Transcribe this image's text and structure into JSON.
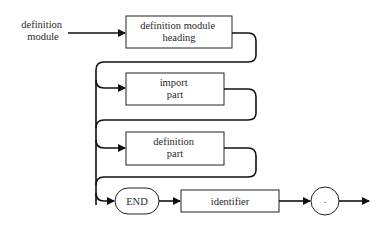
{
  "diagram": {
    "type": "syntax-diagram",
    "entry_label": [
      "definition",
      "module"
    ],
    "nodes": [
      {
        "id": "heading",
        "kind": "nonterminal",
        "lines": [
          "definition module",
          "heading"
        ]
      },
      {
        "id": "import",
        "kind": "nonterminal",
        "lines": [
          "import",
          "part"
        ]
      },
      {
        "id": "definition",
        "kind": "nonterminal",
        "lines": [
          "definition",
          "part"
        ]
      },
      {
        "id": "end",
        "kind": "terminal",
        "lines": [
          "END"
        ]
      },
      {
        "id": "identifier",
        "kind": "nonterminal",
        "lines": [
          "identifier"
        ]
      },
      {
        "id": "period",
        "kind": "terminal",
        "lines": [
          "."
        ]
      }
    ],
    "colors": {
      "stroke": "#111111",
      "text": "#2a2a2a",
      "background": "#ffffff"
    }
  }
}
